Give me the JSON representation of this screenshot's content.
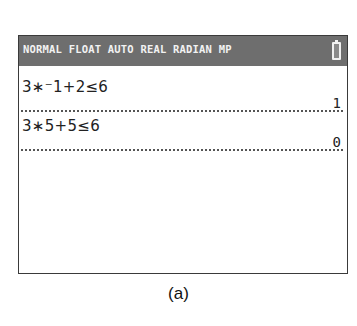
{
  "status_bar": {
    "modes": "NORMAL FLOAT AUTO REAL RADIAN MP",
    "battery_icon": "battery-icon"
  },
  "history": [
    {
      "expression": "3∗⁻1+2≤6",
      "result": "1"
    },
    {
      "expression": "3∗5+5≤6",
      "result": "0"
    }
  ],
  "caption": "(a)",
  "colors": {
    "status_bar_bg": "#6e6e6e",
    "status_bar_text": "#f2f2f2",
    "screen_bg": "#ffffff",
    "border": "#3a3a3a"
  }
}
